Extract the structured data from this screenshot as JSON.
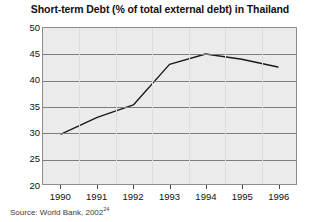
{
  "chart_data": {
    "type": "line",
    "title": "Short-term Debt (% of total external debt) in Thailand",
    "xlabel": "",
    "ylabel": "",
    "categories": [
      "1990",
      "1991",
      "1992",
      "1993",
      "1994",
      "1995",
      "1996"
    ],
    "values": [
      29.6,
      32.8,
      35.2,
      43.0,
      45.0,
      44.0,
      42.5
    ],
    "series": [
      {
        "name": "Short-term Debt (% of total external debt)",
        "values": [
          29.6,
          32.8,
          35.2,
          43.0,
          45.0,
          44.0,
          42.5
        ]
      }
    ],
    "ylim": [
      20,
      50
    ],
    "yticks": [
      50,
      45,
      40,
      35,
      30,
      25,
      20
    ],
    "xticks": [
      "1990",
      "1991",
      "1992",
      "1993",
      "1994",
      "1995",
      "1996"
    ],
    "grid": true,
    "legend": false,
    "legend_position": "none",
    "line_color": "#1a1a1a",
    "plot_background": "#ebebeb",
    "gridline_color": "#7d7d7d"
  },
  "footer": {
    "source_text": "Source: World Bank, 2002",
    "source_footnote": "24"
  }
}
